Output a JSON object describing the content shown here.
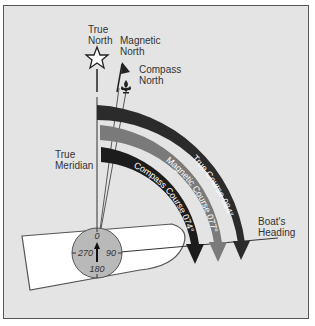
{
  "diagram": {
    "labels": {
      "true_north": [
        "True",
        "North"
      ],
      "magnetic_north": [
        "Magnetic",
        "North"
      ],
      "compass_north": [
        "Compass",
        "North"
      ],
      "true_meridian": [
        "True",
        "Meridian"
      ],
      "boats_heading": [
        "Boat's",
        "Heading"
      ]
    },
    "courses": [
      {
        "label": "True Course 084°",
        "color": "#2b2b2b"
      },
      {
        "label": "Magnetic Course 077°",
        "color": "#7a7a7a"
      },
      {
        "label": "Compass Course 074°",
        "color": "#1c1c1c"
      }
    ],
    "compass_dial": {
      "north": "0",
      "east": "90",
      "south": "180",
      "west": "270",
      "fill": "#b9b9b9"
    },
    "colors": {
      "background": "#e4e4e4",
      "boat_fill": "#ffffff",
      "outline": "#444444"
    }
  }
}
